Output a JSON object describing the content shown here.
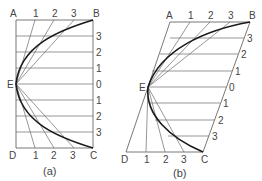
{
  "figures": [
    {
      "id": "a",
      "caption": "(a)",
      "corners": {
        "A": "A",
        "B": "B",
        "C": "C",
        "D": "D",
        "E": "E"
      },
      "top_divisions": [
        "1",
        "2",
        "3"
      ],
      "bottom_divisions": [
        "1",
        "2",
        "3"
      ],
      "right_divisions_upper": [
        "3",
        "2",
        "1"
      ],
      "right_center": "0",
      "right_divisions_lower": [
        "1",
        "2",
        "3"
      ],
      "shape": "rectangle"
    },
    {
      "id": "b",
      "caption": "(b)",
      "corners": {
        "A": "A",
        "B": "B",
        "C": "C",
        "D": "D",
        "E": "E"
      },
      "top_divisions": [
        "1",
        "2",
        "3"
      ],
      "bottom_divisions": [
        "1",
        "2",
        "3"
      ],
      "right_divisions_upper": [
        "3",
        "2",
        "1"
      ],
      "right_center": "0",
      "right_divisions_lower": [
        "1",
        "2",
        "3"
      ],
      "shape": "parallelogram"
    }
  ]
}
